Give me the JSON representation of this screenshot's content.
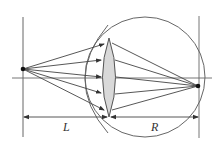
{
  "diagram": {
    "labels": {
      "left_distance": "L",
      "right_distance": "R"
    },
    "elements": {
      "object_point": "point source",
      "image_point": "focused image point on retina",
      "lens": "eye lens",
      "eyeball": "eyeball outline",
      "cornea": "cornea arc",
      "optical_axis": "horizontal axis"
    },
    "ray_count": 5,
    "colors": {
      "line": "#555555",
      "lens_fill": "#d9d9d9",
      "point": "#111111"
    }
  }
}
